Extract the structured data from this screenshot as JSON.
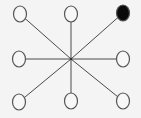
{
  "diagram": {
    "type": "star-graph",
    "background": "#f4f4f4",
    "center": {
      "x": 71,
      "y": 59
    },
    "node_rx": 6.5,
    "node_ry": 8,
    "line_color": "#4a4a4a",
    "node_stroke": "#555555",
    "nodes": [
      {
        "id": "top-left",
        "x": 20,
        "y": 14,
        "filled": false,
        "fill": "#f7f7f7"
      },
      {
        "id": "top-center",
        "x": 71,
        "y": 14,
        "filled": false,
        "fill": "#f7f7f7"
      },
      {
        "id": "top-right",
        "x": 123,
        "y": 13,
        "filled": true,
        "fill": "#0a0a0a"
      },
      {
        "id": "middle-left",
        "x": 19,
        "y": 59,
        "filled": false,
        "fill": "#f7f7f7"
      },
      {
        "id": "middle-right",
        "x": 123,
        "y": 59,
        "filled": false,
        "fill": "#f7f7f7"
      },
      {
        "id": "bottom-left",
        "x": 19,
        "y": 102,
        "filled": false,
        "fill": "#f7f7f7"
      },
      {
        "id": "bottom-center",
        "x": 71,
        "y": 101,
        "filled": false,
        "fill": "#f7f7f7"
      },
      {
        "id": "bottom-right",
        "x": 123,
        "y": 101,
        "filled": false,
        "fill": "#f7f7f7"
      }
    ]
  }
}
